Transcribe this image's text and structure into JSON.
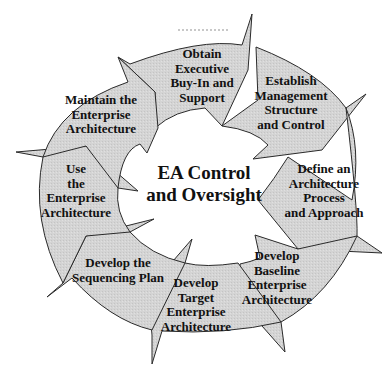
{
  "diagram": {
    "center": {
      "lines": [
        "EA Control",
        "and Oversight"
      ]
    },
    "fill_color": "#d6d6d6",
    "stroke_color": "#333333",
    "steps": [
      {
        "id": "obtain",
        "lines": [
          "Obtain",
          "Executive",
          "Buy-In and",
          "Support"
        ]
      },
      {
        "id": "establish",
        "lines": [
          "Establish",
          "Management",
          "Structure",
          "and Control"
        ]
      },
      {
        "id": "define",
        "lines": [
          "Define an",
          "Architecture",
          "Process",
          "and Approach"
        ]
      },
      {
        "id": "baseline",
        "lines": [
          "Develop",
          "Baseline",
          "Enterprise",
          "Architecture"
        ]
      },
      {
        "id": "target",
        "lines": [
          "Develop",
          "Target",
          "Enterprise",
          "Architecture"
        ]
      },
      {
        "id": "sequencing",
        "lines": [
          "Develop the",
          "Sequencing Plan"
        ]
      },
      {
        "id": "use",
        "lines": [
          "Use",
          "the",
          "Enterprise",
          "Architecture"
        ]
      },
      {
        "id": "maintain",
        "lines": [
          "Maintain the",
          "Enterprise",
          "Architecture"
        ]
      }
    ]
  }
}
